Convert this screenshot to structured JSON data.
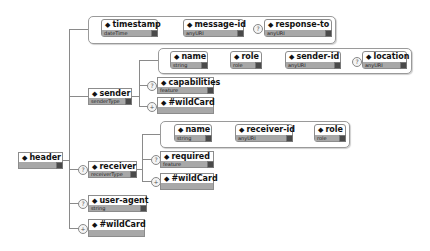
{
  "diagram": {
    "root": {
      "name": "header",
      "type": ""
    },
    "header_attributes": [
      {
        "name": "timestamp",
        "type": "dateTime",
        "optional": false
      },
      {
        "name": "message-id",
        "type": "anyURI",
        "optional": false
      },
      {
        "name": "response-to",
        "type": "anyURI",
        "optional": true
      }
    ],
    "sender": {
      "name": "sender",
      "type": "senderType",
      "attributes": [
        {
          "name": "name",
          "type": "string",
          "optional": false
        },
        {
          "name": "role",
          "type": "role",
          "optional": false
        },
        {
          "name": "sender-id",
          "type": "anyURI",
          "optional": false
        },
        {
          "name": "location",
          "type": "anyURI",
          "optional": true
        }
      ],
      "children": [
        {
          "name": "capabilities",
          "type": "feature",
          "cardinality": "optional"
        },
        {
          "name": "#wildCard",
          "type": "",
          "cardinality": "zero-or-more"
        }
      ]
    },
    "receiver": {
      "name": "receiver",
      "type": "receiverType",
      "optional": true,
      "attributes": [
        {
          "name": "name",
          "type": "string",
          "optional": false
        },
        {
          "name": "receiver-id",
          "type": "anyURI",
          "optional": false
        },
        {
          "name": "role",
          "type": "role",
          "optional": false
        }
      ],
      "children": [
        {
          "name": "required",
          "type": "feature",
          "cardinality": "optional"
        },
        {
          "name": "#wildCard",
          "type": "",
          "cardinality": "zero-or-more"
        }
      ]
    },
    "user_agent": {
      "name": "user-agent",
      "type": "string",
      "cardinality": "optional"
    },
    "wildcard": {
      "name": "#wildCard",
      "type": "",
      "cardinality": "zero-or-more"
    },
    "symbols": {
      "optional": "?",
      "many": "+",
      "bullet": "◆"
    }
  }
}
